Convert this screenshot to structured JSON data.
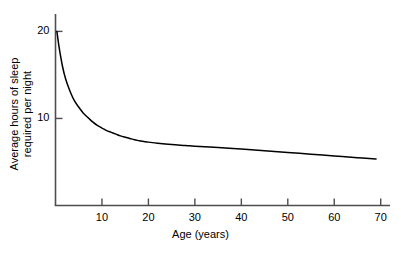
{
  "chart_data": {
    "type": "line",
    "title": "",
    "xlabel": "Age (years)",
    "ylabel_line1": "Average hours of sleep",
    "ylabel_line2": "required per night",
    "xlim": [
      0,
      72
    ],
    "ylim": [
      0,
      22
    ],
    "grid": false,
    "legend": "none",
    "xticks": [
      10,
      20,
      30,
      40,
      50,
      60,
      70
    ],
    "xtick_labels": [
      "10",
      "20",
      "30",
      "40",
      "50",
      "60",
      "70"
    ],
    "yticks": [
      10,
      20
    ],
    "ytick_labels": [
      "10",
      "20"
    ],
    "series": [
      {
        "name": "Average hours of sleep required per night",
        "color": "#000000",
        "x": [
          0.3,
          0.8,
          1.5,
          2.2,
          3,
          4,
          5,
          6,
          7,
          8,
          9,
          10,
          11,
          12,
          13,
          14,
          15,
          16,
          17,
          18,
          19,
          20,
          22,
          25,
          28,
          30,
          35,
          40,
          45,
          50,
          55,
          60,
          65,
          69
        ],
        "y": [
          20,
          18.1,
          16,
          14.5,
          13.3,
          12.1,
          11.3,
          10.6,
          10.1,
          9.6,
          9.2,
          8.9,
          8.6,
          8.4,
          8.2,
          8.0,
          7.85,
          7.7,
          7.55,
          7.45,
          7.35,
          7.28,
          7.15,
          7.0,
          6.9,
          6.82,
          6.65,
          6.5,
          6.3,
          6.1,
          5.9,
          5.7,
          5.5,
          5.35
        ]
      }
    ]
  },
  "axis_color": "#4d4d4d",
  "curve_color": "#1a1a1a"
}
